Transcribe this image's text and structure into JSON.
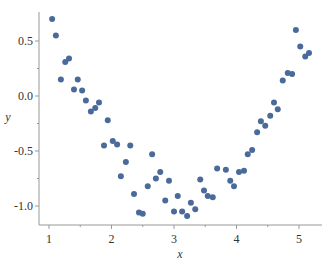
{
  "chart_data": {
    "type": "scatter",
    "title": "",
    "xlabel": "x",
    "ylabel": "y",
    "xlim": [
      0.85,
      5.35
    ],
    "ylim": [
      -1.18,
      0.78
    ],
    "xticks": [
      1,
      2,
      3,
      4,
      5
    ],
    "yticks": [
      0.5,
      0.0,
      -0.5,
      -1.0
    ],
    "ytick_labels": [
      "0.5",
      "0.0",
      "-0.5",
      "-1.0"
    ],
    "grid": false,
    "legend": null,
    "marker_color": "#4a6a9a",
    "series": [
      {
        "name": "data",
        "points": [
          [
            1.05,
            0.7
          ],
          [
            1.11,
            0.55
          ],
          [
            1.19,
            0.15
          ],
          [
            1.26,
            0.31
          ],
          [
            1.32,
            0.34
          ],
          [
            1.4,
            0.06
          ],
          [
            1.46,
            0.15
          ],
          [
            1.53,
            0.05
          ],
          [
            1.59,
            -0.04
          ],
          [
            1.67,
            -0.14
          ],
          [
            1.74,
            -0.11
          ],
          [
            1.8,
            -0.06
          ],
          [
            1.88,
            -0.45
          ],
          [
            1.94,
            -0.22
          ],
          [
            2.02,
            -0.41
          ],
          [
            2.09,
            -0.44
          ],
          [
            2.15,
            -0.73
          ],
          [
            2.23,
            -0.6
          ],
          [
            2.3,
            -0.45
          ],
          [
            2.36,
            -0.89
          ],
          [
            2.44,
            -1.06
          ],
          [
            2.5,
            -1.07
          ],
          [
            2.58,
            -0.82
          ],
          [
            2.65,
            -0.53
          ],
          [
            2.71,
            -0.75
          ],
          [
            2.78,
            -0.69
          ],
          [
            2.86,
            -0.95
          ],
          [
            2.92,
            -0.77
          ],
          [
            3.0,
            -1.05
          ],
          [
            3.06,
            -0.91
          ],
          [
            3.13,
            -1.05
          ],
          [
            3.21,
            -1.09
          ],
          [
            3.27,
            -0.97
          ],
          [
            3.34,
            -1.03
          ],
          [
            3.42,
            -0.76
          ],
          [
            3.48,
            -0.86
          ],
          [
            3.54,
            -0.91
          ],
          [
            3.62,
            -0.92
          ],
          [
            3.69,
            -0.66
          ],
          [
            3.83,
            -0.67
          ],
          [
            3.9,
            -0.77
          ],
          [
            3.96,
            -0.82
          ],
          [
            4.04,
            -0.69
          ],
          [
            4.12,
            -0.68
          ],
          [
            4.18,
            -0.53
          ],
          [
            4.25,
            -0.49
          ],
          [
            4.33,
            -0.33
          ],
          [
            4.39,
            -0.23
          ],
          [
            4.46,
            -0.27
          ],
          [
            4.54,
            -0.18
          ],
          [
            4.6,
            -0.06
          ],
          [
            4.66,
            -0.12
          ],
          [
            4.74,
            0.14
          ],
          [
            4.82,
            0.21
          ],
          [
            4.89,
            0.2
          ],
          [
            4.95,
            0.6
          ],
          [
            5.02,
            0.45
          ],
          [
            5.1,
            0.36
          ],
          [
            5.16,
            0.39
          ]
        ]
      }
    ]
  }
}
